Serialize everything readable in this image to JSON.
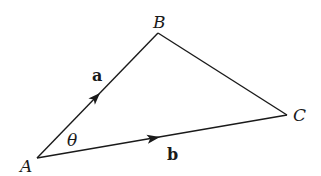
{
  "diagram": {
    "type": "vector-triangle",
    "vertices": {
      "A": {
        "label": "A",
        "x": 37,
        "y": 158
      },
      "B": {
        "label": "B",
        "x": 158,
        "y": 33
      },
      "C": {
        "label": "C",
        "x": 287,
        "y": 115
      }
    },
    "vectors": [
      {
        "name": "a",
        "label": "a",
        "from": "A",
        "to": "B"
      },
      {
        "name": "b",
        "label": "b",
        "from": "A",
        "to": "C"
      }
    ],
    "angle": {
      "label": "θ",
      "at": "A"
    },
    "colors": {
      "line": "#1a1a1a",
      "background": "#ffffff"
    }
  }
}
